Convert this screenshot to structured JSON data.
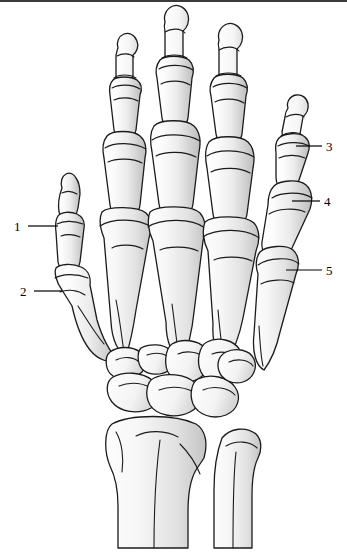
{
  "figure": {
    "background_color": "#ffffff",
    "outline_color": "#1b1b1b",
    "bone_fill_light": "#fbfbfb",
    "bone_fill_shade": "#c9c9c9",
    "label_color": "#000000",
    "border_top_color": "#3a3a3a"
  },
  "callouts": [
    {
      "number": "1",
      "text_x": 14,
      "text_y": 220,
      "leader_x1": 28,
      "leader_y1": 226,
      "leader_x2": 58,
      "leader_y2": 226,
      "target": "thumb-interphalangeal-joint"
    },
    {
      "number": "2",
      "text_x": 20,
      "text_y": 285,
      "leader_x1": 34,
      "leader_y1": 291,
      "leader_x2": 62,
      "leader_y2": 291,
      "target": "thumb-metacarpophalangeal-joint"
    },
    {
      "number": "3",
      "text_x": 326,
      "text_y": 140,
      "leader_x1": 296,
      "leader_y1": 146,
      "leader_x2": 322,
      "leader_y2": 146,
      "target": "little-finger-distal-interphalangeal-joint"
    },
    {
      "number": "4",
      "text_x": 324,
      "text_y": 195,
      "leader_x1": 292,
      "leader_y1": 201,
      "leader_x2": 320,
      "leader_y2": 201,
      "target": "little-finger-proximal-interphalangeal-joint"
    },
    {
      "number": "5",
      "text_x": 326,
      "text_y": 264,
      "leader_x1": 286,
      "leader_y1": 270,
      "leader_x2": 322,
      "leader_y2": 270,
      "target": "little-finger-metacarpophalangeal-joint"
    }
  ],
  "bone_groups": [
    {
      "name": "thumb",
      "parts": [
        "distal phalanx",
        "proximal phalanx",
        "first metacarpal"
      ]
    },
    {
      "name": "index-finger",
      "parts": [
        "distal phalanx",
        "middle phalanx",
        "proximal phalanx",
        "second metacarpal"
      ]
    },
    {
      "name": "middle-finger",
      "parts": [
        "distal phalanx",
        "middle phalanx",
        "proximal phalanx",
        "third metacarpal"
      ]
    },
    {
      "name": "ring-finger",
      "parts": [
        "distal phalanx",
        "middle phalanx",
        "proximal phalanx",
        "fourth metacarpal"
      ]
    },
    {
      "name": "little-finger",
      "parts": [
        "distal phalanx",
        "middle phalanx",
        "proximal phalanx",
        "fifth metacarpal"
      ]
    },
    {
      "name": "carpus",
      "parts": [
        "scaphoid",
        "lunate",
        "triquetrum",
        "pisiform",
        "trapezium",
        "trapezoid",
        "capitate",
        "hamate"
      ]
    },
    {
      "name": "forearm",
      "parts": [
        "radius",
        "ulna"
      ]
    }
  ]
}
